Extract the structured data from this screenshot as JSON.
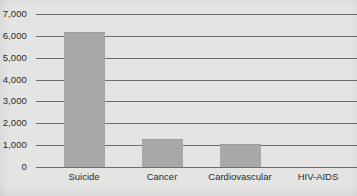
{
  "chart_data": {
    "type": "bar",
    "title": "",
    "subtitle": "",
    "xlabel": "",
    "ylabel": "",
    "categories": [
      "Suicide",
      "Cancer",
      "Cardiovascular",
      "HIV-AIDS"
    ],
    "values": [
      6200,
      1300,
      1050,
      0
    ],
    "ylim": [
      0,
      7000
    ],
    "ytick_values": [
      0,
      1000,
      2000,
      3000,
      4000,
      5000,
      6000,
      7000
    ],
    "ytick_labels": [
      "0",
      "1,000",
      "2,000",
      "3,000",
      "4,000",
      "5,000",
      "6,000",
      "7,000"
    ],
    "grid": true,
    "legend": false,
    "legend_position": "none",
    "annotations": [],
    "colors": {
      "background": "#e4e4e2",
      "bar_fill": "#a8a8a8",
      "bar_edge": "#9a9a9a",
      "gridline": "#6e6e6e",
      "axis_text": "#2b2b2b"
    }
  }
}
